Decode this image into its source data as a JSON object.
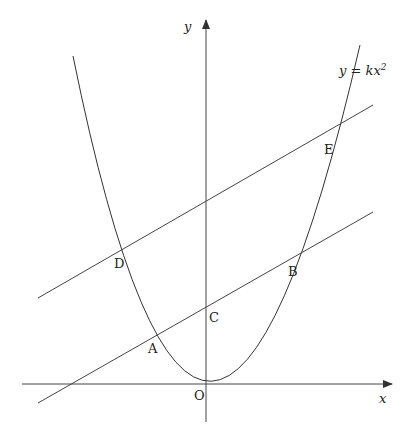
{
  "diagram": {
    "type": "coordinate-geometry",
    "axes": {
      "x_label": "x",
      "y_label": "y",
      "origin_label": "O"
    },
    "curve": {
      "label_lhs": "y = kx",
      "label_exp": "2",
      "equation": "y = kx^2"
    },
    "lines": [
      {
        "name": "upper-line",
        "points": [
          "D",
          "E"
        ]
      },
      {
        "name": "lower-line",
        "points": [
          "A",
          "C",
          "B"
        ]
      }
    ],
    "points": {
      "A": "A",
      "B": "B",
      "C": "C",
      "D": "D",
      "E": "E"
    },
    "colors": {
      "stroke": "#333333",
      "background": "#ffffff"
    }
  }
}
